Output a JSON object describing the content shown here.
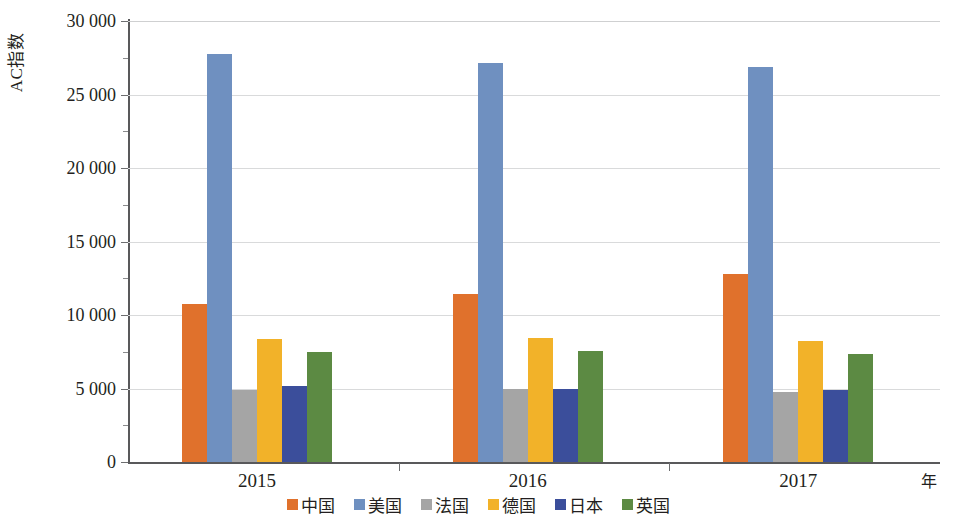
{
  "chart_data": {
    "type": "bar",
    "title": "",
    "xlabel": "年",
    "ylabel": "AC指数",
    "ylim": [
      0,
      30000
    ],
    "ytick_step": 5000,
    "grid": true,
    "legend_position": "bottom",
    "categories": [
      "2015",
      "2016",
      "2017"
    ],
    "ytick_labels": [
      "0",
      "5 000",
      "10 000",
      "15 000",
      "20 000",
      "25 000",
      "30 000"
    ],
    "ytick_values": [
      0,
      5000,
      10000,
      15000,
      20000,
      25000,
      30000
    ],
    "series": [
      {
        "name": "中国",
        "color": "#E0712C",
        "values": [
          10750,
          11400,
          12800
        ]
      },
      {
        "name": "美国",
        "color": "#6F90C0",
        "values": [
          27750,
          27150,
          26900
        ]
      },
      {
        "name": "法国",
        "color": "#A5A5A5",
        "values": [
          4900,
          5000,
          4750
        ]
      },
      {
        "name": "德国",
        "color": "#F2B229",
        "values": [
          8400,
          8450,
          8250
        ]
      },
      {
        "name": "日本",
        "color": "#3B4E9B",
        "values": [
          5150,
          4950,
          4900
        ]
      },
      {
        "name": "英国",
        "color": "#5C8A43",
        "values": [
          7500,
          7550,
          7350
        ]
      }
    ]
  },
  "axes": {
    "y_title": "AC指数",
    "x_unit": "年"
  }
}
